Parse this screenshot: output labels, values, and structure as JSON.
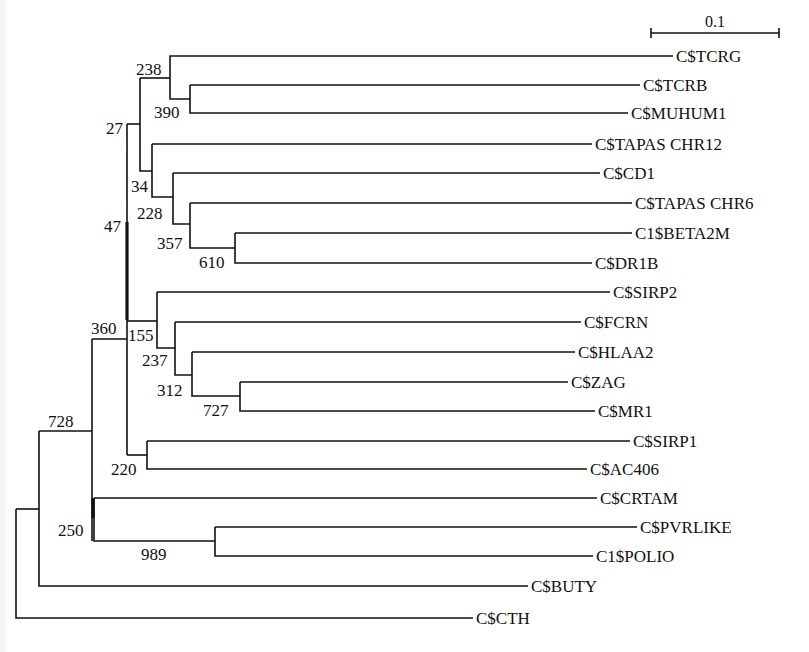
{
  "figure": {
    "type": "phylogenetic-tree",
    "scale_bar": {
      "label": "0.1",
      "x1": 651,
      "x2": 779,
      "y": 33
    },
    "leaves": [
      {
        "name": "C$TCRG",
        "y": 56,
        "x_end": 673
      },
      {
        "name": "C$TCRB",
        "y": 85,
        "x_end": 640
      },
      {
        "name": "C$MUHUM1",
        "y": 113,
        "x_end": 628
      },
      {
        "name": "C$TAPAS CHR12",
        "y": 144,
        "x_end": 592
      },
      {
        "name": "C$CD1",
        "y": 173,
        "x_end": 600
      },
      {
        "name": "C$TAPAS CHR6",
        "y": 203,
        "x_end": 632
      },
      {
        "name": "C1$BETA2M",
        "y": 233,
        "x_end": 632
      },
      {
        "name": "C$DR1B",
        "y": 263,
        "x_end": 592
      },
      {
        "name": "C$SIRP2",
        "y": 292,
        "x_end": 610
      },
      {
        "name": "C$FCRN",
        "y": 322,
        "x_end": 581
      },
      {
        "name": "C$HLAA2",
        "y": 352,
        "x_end": 575
      },
      {
        "name": "C$ZAG",
        "y": 382,
        "x_end": 568
      },
      {
        "name": "C$MR1",
        "y": 411,
        "x_end": 595
      },
      {
        "name": "C$SIRP1",
        "y": 441,
        "x_end": 630
      },
      {
        "name": "C$AC406",
        "y": 469,
        "x_end": 587
      },
      {
        "name": "C$CRTAM",
        "y": 498,
        "x_end": 597
      },
      {
        "name": "C$PVRLIKE",
        "y": 527,
        "x_end": 637
      },
      {
        "name": "C1$POLIO",
        "y": 556,
        "x_end": 593
      },
      {
        "name": "C$BUTY",
        "y": 586,
        "x_end": 528
      },
      {
        "name": "C$CTH",
        "y": 618,
        "x_end": 473
      }
    ],
    "bootstrap_labels": [
      {
        "text": "238",
        "x": 136,
        "y": 75
      },
      {
        "text": "390",
        "x": 154,
        "y": 118
      },
      {
        "text": "27",
        "x": 106,
        "y": 134
      },
      {
        "text": "34",
        "x": 131,
        "y": 192
      },
      {
        "text": "228",
        "x": 137,
        "y": 219
      },
      {
        "text": "47",
        "x": 104,
        "y": 232
      },
      {
        "text": "357",
        "x": 157,
        "y": 249
      },
      {
        "text": "610",
        "x": 199,
        "y": 268
      },
      {
        "text": "360",
        "x": 91,
        "y": 334
      },
      {
        "text": "155",
        "x": 128,
        "y": 341
      },
      {
        "text": "237",
        "x": 142,
        "y": 366
      },
      {
        "text": "312",
        "x": 157,
        "y": 396
      },
      {
        "text": "727",
        "x": 203,
        "y": 416
      },
      {
        "text": "728",
        "x": 48,
        "y": 427
      },
      {
        "text": "220",
        "x": 111,
        "y": 475
      },
      {
        "text": "250",
        "x": 58,
        "y": 536
      },
      {
        "text": "989",
        "x": 141,
        "y": 560
      }
    ]
  }
}
